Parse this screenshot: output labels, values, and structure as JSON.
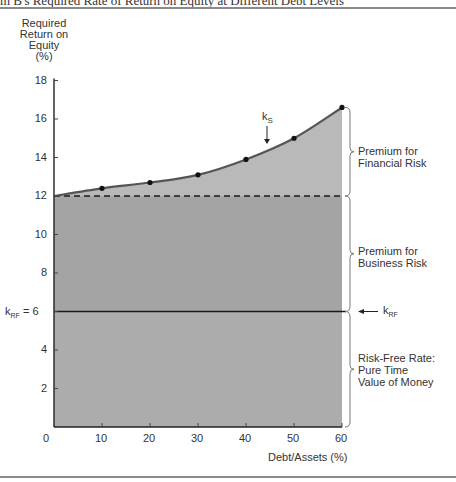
{
  "figure": {
    "title": "m B's Required Rate of Return on Equity at Different Debt Levels"
  },
  "chart_data": {
    "type": "area",
    "title": "m B's Required Rate of Return on Equity at Different Debt Levels",
    "xlabel": "Debt/Assets (%)",
    "ylabel_lines": [
      "Required",
      "Return on",
      "Equity",
      "(%)"
    ],
    "x": [
      0,
      10,
      20,
      30,
      40,
      50,
      60
    ],
    "x_ticks": [
      "0",
      "10",
      "20",
      "30",
      "40",
      "50",
      "60"
    ],
    "y_ticks": [
      "2",
      "4",
      "6",
      "8",
      "10",
      "12",
      "14",
      "16",
      "18"
    ],
    "xlim": [
      0,
      60
    ],
    "ylim": [
      0,
      18
    ],
    "grid": false,
    "series": [
      {
        "name": "kS (Required Return on Equity)",
        "values": [
          12.0,
          12.4,
          12.7,
          13.1,
          13.9,
          15.0,
          16.6
        ],
        "markers": [
          false,
          true,
          true,
          true,
          true,
          true,
          true
        ]
      },
      {
        "name": "Business Risk level (dashed)",
        "values": [
          12,
          12,
          12,
          12,
          12,
          12,
          12
        ]
      },
      {
        "name": "kRF (Risk-Free Rate)",
        "values": [
          6,
          6,
          6,
          6,
          6,
          6,
          6
        ]
      }
    ],
    "annotations": {
      "ks_label": "k",
      "ks_sub": "S",
      "krf_left_label": "k",
      "krf_left_sub": "RF",
      "krf_left_value": " = 6",
      "krf_right_label": "k",
      "krf_right_sub": "RF",
      "regions": [
        {
          "name": "financial",
          "lines": [
            "Premium for",
            "Financial Risk"
          ]
        },
        {
          "name": "business",
          "lines": [
            "Premium for",
            "Business Risk"
          ]
        },
        {
          "name": "riskfree",
          "lines": [
            "Risk-Free Rate:",
            "Pure Time",
            "Value of Money"
          ]
        }
      ]
    },
    "colors": {
      "financial_fill": "#b9b9b9",
      "business_fill": "#a4a4a4",
      "riskfree_fill": "#acacac",
      "curve": "#555555",
      "line": "#1a1a1a"
    }
  }
}
